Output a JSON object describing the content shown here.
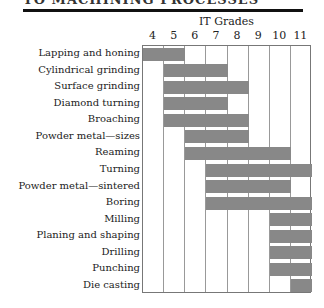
{
  "page": {
    "header_text": "TO MACHINING PROCESSES"
  },
  "chart_data": {
    "type": "bar",
    "orientation": "horizontal-range",
    "title": "IT Grades",
    "xlabel": "IT Grades",
    "ylabel": "",
    "x_ticks": [
      "4",
      "5",
      "6",
      "7",
      "8",
      "9",
      "10",
      "11"
    ],
    "xlim": [
      4,
      11
    ],
    "grid": true,
    "legend": null,
    "bar_color": "#888888",
    "categories": [
      "Lapping and honing",
      "Cylindrical grinding",
      "Surface grinding",
      "Diamond turning",
      "Broaching",
      "Powder metal—sizes",
      "Reaming",
      "Turning",
      "Powder metal—sintered",
      "Boring",
      "Milling",
      "Planing and shaping",
      "Drilling",
      "Punching",
      "Die casting"
    ],
    "ranges": [
      {
        "from": 4,
        "to": 5
      },
      {
        "from": 5,
        "to": 7
      },
      {
        "from": 5,
        "to": 8
      },
      {
        "from": 5,
        "to": 7
      },
      {
        "from": 5,
        "to": 8
      },
      {
        "from": 6,
        "to": 8
      },
      {
        "from": 6,
        "to": 10
      },
      {
        "from": 7,
        "to": 11
      },
      {
        "from": 7,
        "to": 10
      },
      {
        "from": 7,
        "to": 11
      },
      {
        "from": 10,
        "to": 11
      },
      {
        "from": 10,
        "to": 11
      },
      {
        "from": 10,
        "to": 11
      },
      {
        "from": 10,
        "to": 11
      },
      {
        "from": 11,
        "to": 11
      }
    ]
  }
}
